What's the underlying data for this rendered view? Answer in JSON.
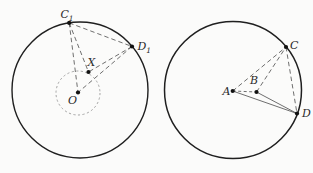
{
  "diagram": {
    "background": "#fbfbfa",
    "canvas": {
      "width": 313,
      "height": 173
    },
    "colors": {
      "outline": "#1f1f1f",
      "segment": "#4a4a4a",
      "inner_circle": "#8f8f8f",
      "dot": "#111111"
    },
    "figures": [
      {
        "id": "left-circle-figure",
        "circles": [
          {
            "name": "outer-circle",
            "cx": 80,
            "cy": 90,
            "r": 68,
            "style": "solid",
            "width": 1.4,
            "color": "#1f1f1f"
          },
          {
            "name": "inner-dashed-circle",
            "cx": 78,
            "cy": 93,
            "r": 22,
            "style": "dashed",
            "dash": "2.2 2.4",
            "width": 0.8,
            "color": "#8f8f8f"
          }
        ],
        "points": [
          {
            "id": "C1",
            "x": 69.2,
            "y": 22.9,
            "label": "C",
            "sub": "1",
            "label_x": 67,
            "label_y": 18,
            "anchor": "middle"
          },
          {
            "id": "D1",
            "x": 132,
            "y": 46.5,
            "label": "D",
            "sub": "1",
            "label_x": 137.5,
            "label_y": 50,
            "anchor": "start"
          },
          {
            "id": "X",
            "x": 88.5,
            "y": 72,
            "label": "X",
            "sub": "",
            "label_x": 91.5,
            "label_y": 66,
            "anchor": "middle"
          },
          {
            "id": "O",
            "x": 78,
            "y": 92.5,
            "label": "O",
            "sub": "",
            "label_x": 72.5,
            "label_y": 103.5,
            "anchor": "middle"
          }
        ],
        "segments": [
          {
            "from": "C1",
            "to": "D1",
            "style": "dashed",
            "dash": "4.5 3"
          },
          {
            "from": "C1",
            "to": "X",
            "style": "dashed",
            "dash": "4.5 3"
          },
          {
            "from": "C1",
            "to": "O",
            "style": "dashed",
            "dash": "4.5 3"
          },
          {
            "from": "D1",
            "to": "X",
            "style": "dashed",
            "dash": "4.5 3"
          },
          {
            "from": "D1",
            "to": "O",
            "style": "dashed",
            "dash": "4.5 3"
          }
        ]
      },
      {
        "id": "right-circle-figure",
        "circles": [
          {
            "name": "outer-circle",
            "cx": 233,
            "cy": 90,
            "r": 68.5,
            "style": "solid",
            "width": 1.5,
            "color": "#1f1f1f"
          }
        ],
        "points": [
          {
            "id": "A",
            "x": 232.7,
            "y": 91,
            "label": "A",
            "sub": "",
            "label_x": 226.5,
            "label_y": 95,
            "anchor": "middle"
          },
          {
            "id": "B",
            "x": 256.5,
            "y": 92,
            "label": "B",
            "sub": "",
            "label_x": 254,
            "label_y": 84,
            "anchor": "middle"
          },
          {
            "id": "C",
            "x": 286,
            "y": 47,
            "label": "C",
            "sub": "",
            "label_x": 290,
            "label_y": 49,
            "anchor": "start"
          },
          {
            "id": "D",
            "x": 297,
            "y": 113.5,
            "label": "D",
            "sub": "",
            "label_x": 302,
            "label_y": 117,
            "anchor": "start"
          }
        ],
        "segments": [
          {
            "from": "A",
            "to": "B",
            "style": "dashed",
            "dash": "3 2.5"
          },
          {
            "from": "A",
            "to": "C",
            "style": "dashed",
            "dash": "4.5 3"
          },
          {
            "from": "B",
            "to": "C",
            "style": "dashed",
            "dash": "4.5 3"
          },
          {
            "from": "C",
            "to": "D",
            "style": "dashed",
            "dash": "4.5 3"
          },
          {
            "from": "A",
            "to": "D",
            "style": "solid"
          },
          {
            "from": "B",
            "to": "D",
            "style": "solid"
          }
        ]
      }
    ],
    "label_font_size": 11,
    "sub_font_size": 7.5,
    "dot_radius": 2.1
  }
}
